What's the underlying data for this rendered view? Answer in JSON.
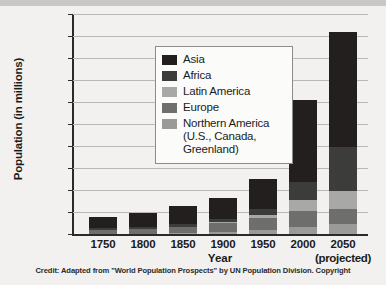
{
  "chart_data": {
    "type": "bar",
    "subtype": "stacked-bar",
    "title": "",
    "xlabel": "Year",
    "ylabel": "Population (in millions)",
    "ylim": [
      0,
      10000
    ],
    "ytick_step": 1000,
    "ytick_labels": [
      "10,000",
      "9,000",
      "8,000",
      "7,000",
      "6,000",
      "5,000",
      "4,000",
      "3,000",
      "2,000",
      "1,000",
      "0"
    ],
    "ytick_values": [
      10000,
      9000,
      8000,
      7000,
      6000,
      5000,
      4000,
      3000,
      2000,
      1000,
      0
    ],
    "grid": true,
    "legend_position": "upper-left-inside",
    "categories": [
      "1750",
      "1800",
      "1850",
      "1900",
      "1950",
      "2000",
      "2050"
    ],
    "category_sublabels": [
      "",
      "",
      "",
      "",
      "",
      "",
      "(projected)"
    ],
    "series": [
      {
        "name": "Northern America (U.S., Canada, Greenland)",
        "short_name": "Northern America",
        "color": "#9a9a98",
        "values": [
          2,
          7,
          26,
          82,
          172,
          314,
          448
        ]
      },
      {
        "name": "Europe",
        "color": "#6e6e6c",
        "values": [
          163,
          203,
          276,
          408,
          547,
          727,
          691
        ]
      },
      {
        "name": "Latin America",
        "color": "#a8a8a6",
        "values": [
          16,
          24,
          38,
          74,
          167,
          521,
          809
        ]
      },
      {
        "name": "Africa",
        "color": "#3c3c3a",
        "values": [
          106,
          107,
          111,
          133,
          229,
          819,
          1998
        ]
      },
      {
        "name": "Asia",
        "color": "#231f1e",
        "values": [
          502,
          635,
          809,
          947,
          1402,
          3714,
          5217
        ]
      }
    ],
    "stack_order_bottom_to_top": [
      "Northern America",
      "Europe",
      "Latin America",
      "Africa",
      "Asia"
    ],
    "totals": [
      789,
      976,
      1260,
      1644,
      2517,
      6095,
      9163
    ]
  },
  "legend": {
    "items": [
      {
        "label": "Asia",
        "continuation": "",
        "color": "#231f1e"
      },
      {
        "label": "Africa",
        "continuation": "",
        "color": "#3c3c3a"
      },
      {
        "label": "Latin America",
        "continuation": "",
        "color": "#a8a8a6"
      },
      {
        "label": "Europe",
        "continuation": "",
        "color": "#6e6e6c"
      },
      {
        "label": "Northern America",
        "continuation": "(U.S., Canada, Greenland)",
        "color": "#9a9a98"
      }
    ]
  },
  "credit": {
    "text": "Credit: Adapted from \"World Population Prospects\" by UN Population Division. Copyright"
  }
}
